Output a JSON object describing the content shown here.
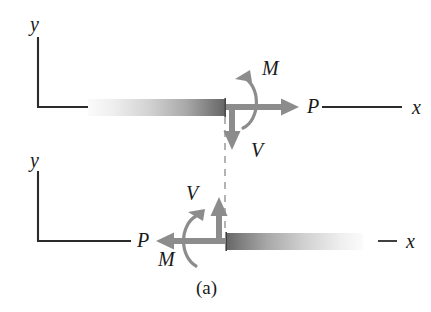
{
  "figure": {
    "caption": "(a)",
    "caption_x": 196,
    "caption_y": 278,
    "background_color": "#ffffff",
    "axis_line_color": "#2b2b2b",
    "force_arrow_color": "#8c8c8c",
    "moment_arc_color": "#8c8c8c",
    "beam_dark_color": "#595959",
    "beam_light_color": "#f2f2f2",
    "cut_line_color": "#9a9a9a",
    "text_color": "#1a1a1a"
  },
  "upper_segment": {
    "axis_y_label": "y",
    "axis_y_label_x": 30,
    "axis_y_label_y": 14,
    "axis_x_label": "x",
    "axis_x_label_x": 412,
    "axis_x_label_y": 97,
    "axial_force_label": "P",
    "axial_force_label_x": 307,
    "axial_force_label_y": 96,
    "moment_label": "M",
    "moment_label_x": 262,
    "moment_label_y": 68,
    "shear_label": "V",
    "shear_label_x": 251,
    "shear_label_y": 140,
    "axial_force_direction": "right",
    "shear_direction": "down",
    "moment_direction": "counterclockwise",
    "beam_gradient": "light-to-dark"
  },
  "lower_segment": {
    "axis_y_label": "y",
    "axis_y_label_x": 30,
    "axis_y_label_y": 150,
    "axis_x_label": "x",
    "axis_x_label_x": 406,
    "axis_x_label_y": 231,
    "axial_force_label": "P",
    "axial_force_label_x": 137,
    "axial_force_label_y": 230,
    "moment_label": "M",
    "moment_label_x": 160,
    "moment_label_y": 249,
    "shear_label": "V",
    "shear_label_x": 186,
    "shear_label_y": 183,
    "axial_force_direction": "left",
    "shear_direction": "up",
    "moment_direction": "clockwise",
    "beam_gradient": "dark-to-light"
  }
}
